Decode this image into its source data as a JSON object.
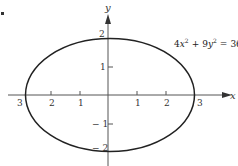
{
  "figure": {
    "equation": {
      "lhs_term1_coef": "4",
      "lhs_term1_var": "x",
      "lhs_term1_exp": "2",
      "plus": "+",
      "lhs_term2_coef": "9",
      "lhs_term2_var": "y",
      "lhs_term2_exp": "2",
      "equals": "=",
      "rhs": "36",
      "full_text": "4x² + 9y² = 36"
    },
    "axes": {
      "x_label": "x",
      "y_label": "y",
      "x_ticks": [
        "3",
        "2",
        "1",
        "1",
        "2",
        "3"
      ],
      "y_ticks": [
        "2",
        "1",
        "− 1",
        "− 2"
      ]
    },
    "marker": "•",
    "colors": {
      "curve": "#222222",
      "axis": "#444444",
      "text": "#333333"
    }
  }
}
